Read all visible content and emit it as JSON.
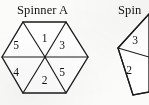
{
  "figure": {
    "title_left": "Spinner A",
    "title_right": "Spinner B",
    "title_right_visible": "Spin",
    "background_color": "#fbfbfa",
    "ink_color": "#1b1b1b"
  },
  "spinner_a": {
    "name": "Spinner A",
    "shape": "hexagon",
    "sector_count": 6,
    "sectors": [
      {
        "position": "top",
        "value": "1"
      },
      {
        "position": "upper-right",
        "value": "3"
      },
      {
        "position": "lower-right",
        "value": "5"
      },
      {
        "position": "bottom",
        "value": "2"
      },
      {
        "position": "lower-left",
        "value": "4"
      },
      {
        "position": "upper-left",
        "value": "5"
      }
    ],
    "values": [
      "1",
      "3",
      "5",
      "2",
      "4",
      "5"
    ]
  },
  "spinner_b": {
    "name": "Spinner B",
    "shape": "polygon",
    "cropped": true,
    "visible_sectors": [
      {
        "position": "upper",
        "value": "3"
      },
      {
        "position": "lower",
        "value": "2"
      }
    ],
    "values": [
      "3",
      "2"
    ]
  }
}
